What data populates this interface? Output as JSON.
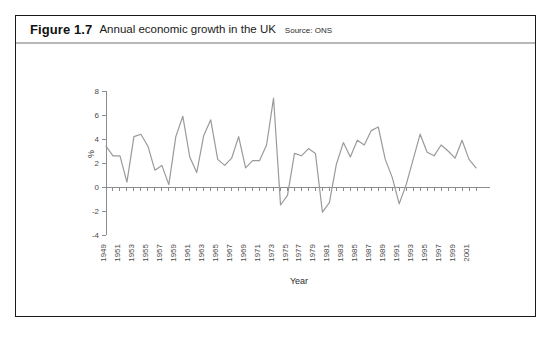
{
  "figure": {
    "number": "Figure 1.7",
    "title": "Annual economic growth in the UK",
    "source": "Source: ONS"
  },
  "chart_data": {
    "type": "line",
    "title": "Annual economic growth in the UK",
    "xlabel": "Year",
    "ylabel": "%",
    "ylim": [
      -4,
      8
    ],
    "yticks": [
      -4,
      -2,
      0,
      2,
      4,
      6,
      8
    ],
    "xlim": [
      1949,
      2002
    ],
    "xticks": [
      1949,
      1951,
      1953,
      1955,
      1957,
      1959,
      1961,
      1963,
      1965,
      1967,
      1969,
      1971,
      1973,
      1975,
      1977,
      1979,
      1981,
      1983,
      1985,
      1987,
      1989,
      1991,
      1993,
      1995,
      1997,
      1999,
      2001
    ],
    "grid": false,
    "legend": "none",
    "line_color": "#9a9a9a",
    "x": [
      1949,
      1950,
      1951,
      1952,
      1953,
      1954,
      1955,
      1956,
      1957,
      1958,
      1959,
      1960,
      1961,
      1962,
      1963,
      1964,
      1965,
      1966,
      1967,
      1968,
      1969,
      1970,
      1971,
      1972,
      1973,
      1974,
      1975,
      1976,
      1977,
      1978,
      1979,
      1980,
      1981,
      1982,
      1983,
      1984,
      1985,
      1986,
      1987,
      1988,
      1989,
      1990,
      1991,
      1992,
      1993,
      1994,
      1995,
      1996,
      1997,
      1998,
      1999,
      2000,
      2001,
      2002
    ],
    "values": [
      3.4,
      2.6,
      2.6,
      0.4,
      4.2,
      4.4,
      3.4,
      1.4,
      1.8,
      0.2,
      4.2,
      5.9,
      2.5,
      1.2,
      4.3,
      5.6,
      2.3,
      1.8,
      2.4,
      4.2,
      1.6,
      2.2,
      2.2,
      3.5,
      7.4,
      -1.5,
      -0.7,
      2.8,
      2.6,
      3.2,
      2.8,
      -2.1,
      -1.3,
      1.9,
      3.7,
      2.5,
      3.9,
      3.5,
      4.7,
      5.0,
      2.3,
      0.8,
      -1.4,
      0.2,
      2.3,
      4.4,
      2.9,
      2.6,
      3.5,
      3.0,
      2.4,
      3.9,
      2.3,
      1.6
    ]
  }
}
